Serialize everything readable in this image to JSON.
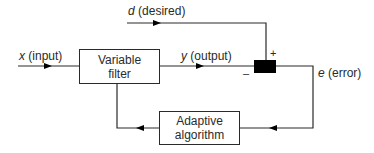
{
  "diagram": {
    "signals": {
      "input": {
        "symbol": "x",
        "label": "(input)"
      },
      "desired": {
        "symbol": "d",
        "label": "(desired)"
      },
      "output": {
        "symbol": "y",
        "label": "(output)"
      },
      "error": {
        "symbol": "e",
        "label": "(error)"
      }
    },
    "blocks": {
      "filter": {
        "line1": "Variable",
        "line2": "filter"
      },
      "algorithm": {
        "line1": "Adaptive",
        "line2": "algorithm"
      }
    },
    "junction": {
      "plus": "+",
      "minus": "–"
    },
    "colors": {
      "line": "#2a2a2a",
      "junction": "#000000",
      "background": "#ffffff"
    }
  }
}
